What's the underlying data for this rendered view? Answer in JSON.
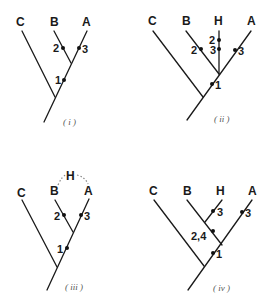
{
  "panels": [
    {
      "caption": "( i )",
      "taxa": {
        "C": "C",
        "B": "B",
        "A": "A"
      },
      "marks": {
        "b": "2",
        "a": "3",
        "stem": "1"
      }
    },
    {
      "caption": "( ii )",
      "taxa": {
        "C": "C",
        "B": "B",
        "H": "H",
        "A": "A"
      },
      "marks": {
        "h_top": "2",
        "h_low": "3",
        "b": "2",
        "a": "3",
        "stem": "1"
      }
    },
    {
      "caption": "( iii )",
      "taxa": {
        "C": "C",
        "B": "B",
        "H": "H",
        "A": "A"
      },
      "marks": {
        "b": "2",
        "a": "3",
        "stem": "1"
      }
    },
    {
      "caption": "( iv )",
      "taxa": {
        "C": "C",
        "B": "B",
        "H": "H",
        "A": "A"
      },
      "marks": {
        "h": "3",
        "a": "3",
        "bh": "2,4",
        "stem": "1"
      }
    }
  ],
  "colors": {
    "line": "#1a1a1a",
    "caption": "#555555",
    "dotted": "#888888"
  }
}
